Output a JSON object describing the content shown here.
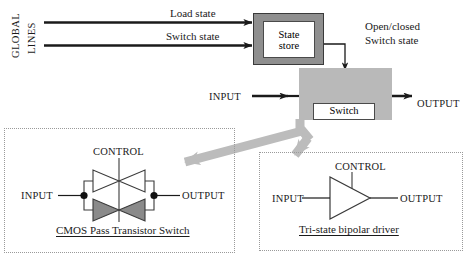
{
  "figure": {
    "background": "#ffffff",
    "line_color": "#1a1a1a",
    "gray_fill": "#b9b9b9",
    "gray_arrow": "#bcbcbc",
    "store_frame": "#8f8f8f",
    "dash_border": "#9a9a9a"
  },
  "global_lines": {
    "axis_label_top": "GLOBAL",
    "axis_label_bottom": "LINES",
    "lines": [
      {
        "label": "Load state"
      },
      {
        "label": "Switch state"
      }
    ]
  },
  "state_store": {
    "line1": "State",
    "line2": "store"
  },
  "switch_block": {
    "annotation_line1": "Open/closed",
    "annotation_line2": "Switch state",
    "label": "Switch",
    "input_label": "INPUT",
    "output_label": "OUTPUT"
  },
  "cmos_panel": {
    "caption": "CMOS Pass Transistor Switch",
    "control_label": "CONTROL",
    "input_label": "INPUT",
    "output_label": "OUTPUT"
  },
  "tristate_panel": {
    "caption": "Tri-state bipolar driver",
    "control_label": "CONTROL",
    "input_label": "INPUT",
    "output_label": "OUTPUT"
  }
}
